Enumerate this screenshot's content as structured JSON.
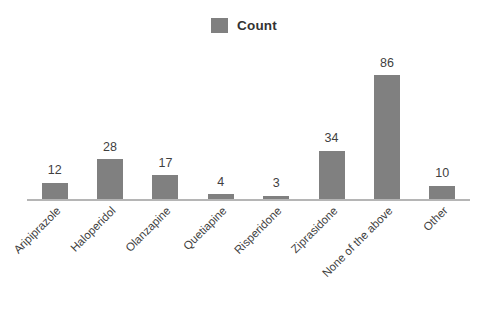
{
  "chart_data": {
    "type": "bar",
    "title": "",
    "subtitle": "",
    "xlabel": "",
    "ylabel": "",
    "categories": [
      "Aripiprazole",
      "Haloperidol",
      "Olanzapine",
      "Quetiapine",
      "Risperidone",
      "Ziprasidone",
      "None of the above",
      "Other"
    ],
    "values": [
      12,
      28,
      17,
      4,
      3,
      34,
      86,
      10
    ],
    "series": [
      {
        "name": "Count",
        "values": [
          12,
          28,
          17,
          4,
          3,
          34,
          86,
          10
        ]
      }
    ],
    "ylim": [
      0,
      100
    ],
    "grid": false,
    "axis_ticks_visible": false,
    "data_labels": true,
    "legend": {
      "position": "top-center",
      "entries": [
        {
          "label": "Count",
          "color": "#808080"
        }
      ]
    },
    "colors": {
      "bar": "#808080",
      "axis_line": "#b5b5b5",
      "text": "#3f3f3f",
      "legend_text": "#333333",
      "background": "#ffffff"
    }
  }
}
